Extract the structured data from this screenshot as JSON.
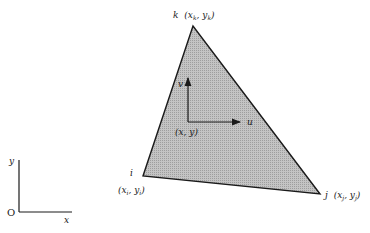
{
  "diagram": {
    "type": "triangular finite element with local displacement axes",
    "colors": {
      "element_fill": "#b8b8b8",
      "stroke": "#1a1a1a",
      "background": "#ffffff"
    },
    "global_axes": {
      "origin_label": "O",
      "x_label": "x",
      "y_label": "y"
    },
    "element": {
      "nodes": [
        {
          "id": "k",
          "label": "k",
          "coords": "(x",
          "sub1": "k",
          "mid": ", y",
          "sub2": "k",
          "close": ")"
        },
        {
          "id": "i",
          "label": "i",
          "coords": "(x",
          "sub1": "i",
          "mid": ", y",
          "sub2": "i",
          "close": ")"
        },
        {
          "id": "j",
          "label": "j",
          "coords": "(x",
          "sub1": "j",
          "mid": ", y",
          "sub2": "j",
          "close": ")"
        }
      ]
    },
    "local_axes": {
      "point_label": "(x, y)",
      "u_label": "u",
      "v_label": "v"
    }
  }
}
